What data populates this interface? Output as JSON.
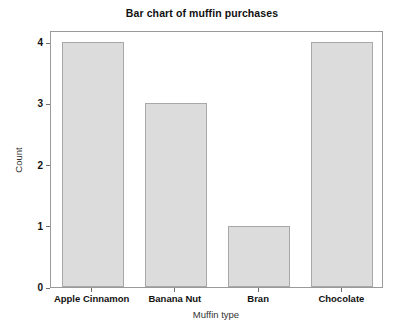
{
  "chart_data": {
    "type": "bar",
    "title": "Bar chart of muffin purchases",
    "xlabel": "Muffin type",
    "ylabel": "Count",
    "categories": [
      "Apple Cinnamon",
      "Banana Nut",
      "Bran",
      "Chocolate"
    ],
    "values": [
      4,
      3,
      1,
      4
    ],
    "ylim": [
      0,
      4.2
    ],
    "yticks": [
      0,
      1,
      2,
      3,
      4
    ],
    "ytick_labels": [
      "0",
      "1",
      "2",
      "3",
      "4"
    ],
    "grid": false,
    "legend": "none",
    "bar_fill_color": "#dcdcdc",
    "bar_edge_color": "#a8a8a8",
    "frame_color": "#9a9a9a",
    "background_color": "#ffffff"
  }
}
